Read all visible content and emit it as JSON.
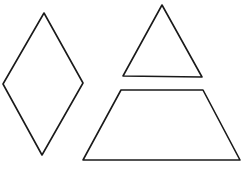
{
  "diagram": {
    "background": "#ffffff",
    "stroke_color": "#1a1a1a",
    "stroke_width": 1.6,
    "shapes": [
      {
        "name": "rhombus",
        "points": "44,13 83,83 42,155 3,84"
      },
      {
        "name": "triangle",
        "points": "162,5 202,77 123,76"
      },
      {
        "name": "trapezoid",
        "points": "121,90 203,90 240,160 83,160"
      }
    ]
  }
}
